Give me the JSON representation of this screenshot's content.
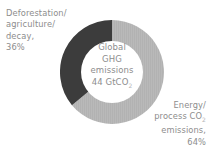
{
  "chart_data": {
    "type": "pie",
    "variant": "donut",
    "title": "",
    "center_label": {
      "lines": [
        "Global",
        "GHG",
        "emissions",
        "44 GtCO"
      ],
      "unit_subscript": "2",
      "total_value": 44,
      "total_unit": "GtCO2"
    },
    "categories": [
      "Deforestation/agriculture/decay",
      "Energy/process CO2 emissions"
    ],
    "values": [
      36,
      64
    ],
    "value_unit": "%",
    "colors": [
      "#3c3c3c",
      "#b9b9b9"
    ],
    "legend_position": "outside-labels",
    "start_angle_deg": 0,
    "direction": "clockwise",
    "slices": [
      {
        "name": "Deforestation/agriculture/decay",
        "value": 36,
        "label_lines": [
          "Deforestation/",
          "agriculture/",
          "decay,",
          "36%"
        ],
        "color": "#3c3c3c",
        "label_position": "top-left"
      },
      {
        "name": "Energy/process CO2 emissions",
        "value": 64,
        "label_lines": [
          "Energy/",
          "process CO",
          "emissions,",
          "64%"
        ],
        "label_subscript": "2",
        "color": "#b9b9b9",
        "label_position": "bottom-right"
      }
    ]
  },
  "labels": {
    "left": {
      "line1": "Deforestation/",
      "line2": "agriculture/",
      "line3": "decay,",
      "line4": "36%"
    },
    "right": {
      "line1": "Energy/",
      "line2": "process CO",
      "line2_sub": "2",
      "line3": "emissions,",
      "line4": "64%"
    }
  },
  "center": {
    "line1": "Global",
    "line2": "GHG",
    "line3": "emissions",
    "line4": "44 GtCO",
    "line4_sub": "2"
  },
  "colors": {
    "slice_dark": "#3c3c3c",
    "slice_light": "#b9b9b9",
    "text": "#8d8d8d",
    "background": "#ffffff"
  }
}
